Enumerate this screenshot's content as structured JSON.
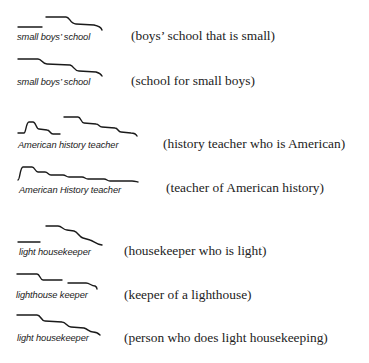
{
  "examples": [
    {
      "phrase": "small boys’ school",
      "gloss": "(boys’ school that is small)"
    },
    {
      "phrase": "small boys’ school",
      "gloss": "(school for small boys)"
    },
    {
      "phrase": "American history teacher",
      "gloss": "(history teacher who is American)"
    },
    {
      "phrase": "American History teacher",
      "gloss": "(teacher of American history)"
    },
    {
      "phrase": "light housekeeper",
      "gloss": "(housekeeper who is light)"
    },
    {
      "phrase": "lighthouse keeper",
      "gloss": "(keeper of a lighthouse)"
    },
    {
      "phrase": "light housekeeper",
      "gloss": "(person who does light housekeeping)"
    }
  ],
  "ink_color": "#1a1a1a"
}
